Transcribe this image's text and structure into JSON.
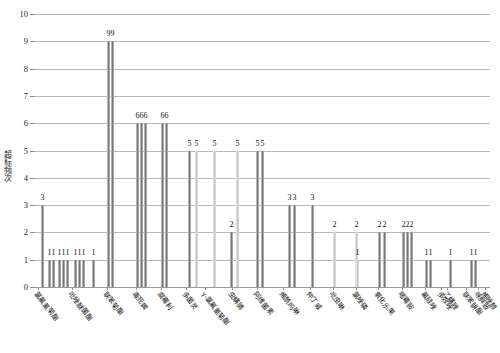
{
  "chart_data": {
    "type": "bar",
    "title": "",
    "subtitle": "",
    "xlabel": "",
    "ylabel": "超标频次",
    "ylim": [
      0,
      10
    ],
    "yticks": [
      0,
      1,
      2,
      3,
      4,
      5,
      6,
      7,
      8,
      9,
      10
    ],
    "ytick_labels": [
      "0",
      "1",
      "2",
      "3",
      "4",
      "5",
      "6",
      "7",
      "8",
      "9",
      "10"
    ],
    "grid": true,
    "legend": null,
    "bar_color": "#8f8f8f",
    "categories": [
      "氯氟氰菊酯",
      "氯氰菊酯",
      "吡唑醚菌酯",
      "腐霉利",
      "联苯菊酯",
      "毒死蜱",
      "克百威",
      "多菌灵",
      "甲拌磷",
      "氟虫腈",
      "啶虫脒",
      "三唑磷",
      "乙酰甲胺磷",
      "灭多威",
      "氧乐果",
      "氟氯氰菊酯",
      "γ-氯氟氰菊酯",
      "丙溴磷",
      "虫螨腈",
      "苯醚甲环唑",
      "阿维菌素",
      "烯酰吗啉",
      "吡虫啉",
      "哒螨灵",
      "仲丁威",
      "氯唑磷",
      "吡蚜酮",
      "氧化乐果",
      "敌敌畏",
      "噻虫嗪",
      "嘧霉胺",
      "戊唑醇",
      "氟硅唑",
      "乙螨唑",
      "灭蝇胺",
      "联苯肼酯",
      "唑螨酯",
      "烯唑醇",
      "多效唑",
      "甲霜灵",
      "水胺硫磷",
      "异丙威",
      "喹硫磷",
      "噻嗪酮",
      "百菌清",
      "氯吡脲",
      "咪鲜胺"
    ],
    "values": [
      3,
      1,
      1,
      1,
      1,
      1,
      1,
      1,
      1,
      1,
      9,
      9,
      6,
      6,
      6,
      6,
      6,
      5,
      5,
      5,
      5,
      5,
      5,
      2,
      3,
      3,
      3,
      2,
      2,
      1,
      2,
      2,
      2,
      2,
      2,
      1,
      1,
      1,
      1,
      1,
      1,
      1,
      1,
      1,
      6,
      1,
      1
    ],
    "bars": [
      {
        "x": 41,
        "v": 3,
        "label": "3",
        "lx": 41,
        "pale": false
      },
      {
        "x": 48,
        "v": 1,
        "label": "1",
        "lx": 48,
        "pale": false
      },
      {
        "x": 52,
        "v": 1,
        "label": "1",
        "lx": 52,
        "pale": false
      },
      {
        "x": 58,
        "v": 1,
        "label": "1",
        "lx": 58,
        "pale": false
      },
      {
        "x": 62,
        "v": 1,
        "label": "1",
        "lx": 62,
        "pale": false
      },
      {
        "x": 66,
        "v": 1,
        "label": "1",
        "lx": 66,
        "pale": false
      },
      {
        "x": 74,
        "v": 1,
        "label": "1",
        "lx": 74,
        "pale": false
      },
      {
        "x": 78,
        "v": 1,
        "label": "1",
        "lx": 78,
        "pale": false
      },
      {
        "x": 82,
        "v": 1,
        "label": "1",
        "lx": 82,
        "pale": false
      },
      {
        "x": 92,
        "v": 1,
        "label": "1",
        "lx": 92,
        "pale": false
      },
      {
        "x": 107,
        "v": 9,
        "label": "9",
        "lx": 107,
        "pale": false
      },
      {
        "x": 111,
        "v": 9,
        "label": "9",
        "lx": 111,
        "pale": false
      },
      {
        "x": 136,
        "v": 6,
        "label": "6",
        "lx": 136,
        "pale": false
      },
      {
        "x": 140,
        "v": 6,
        "label": "6",
        "lx": 140,
        "pale": false
      },
      {
        "x": 144,
        "v": 6,
        "label": "6",
        "lx": 144,
        "pale": false
      },
      {
        "x": 161,
        "v": 6,
        "label": "6",
        "lx": 161,
        "pale": false
      },
      {
        "x": 165,
        "v": 6,
        "label": "6",
        "lx": 165,
        "pale": false
      },
      {
        "x": 188,
        "v": 5,
        "label": "5",
        "lx": 188,
        "pale": false
      },
      {
        "x": 195,
        "v": 5,
        "label": "5",
        "lx": 195,
        "pale": true
      },
      {
        "x": 213,
        "v": 5,
        "label": "5",
        "lx": 213,
        "pale": true
      },
      {
        "x": 236,
        "v": 5,
        "label": "5",
        "lx": 236,
        "pale": true
      },
      {
        "x": 256,
        "v": 5,
        "label": "5",
        "lx": 256,
        "pale": false
      },
      {
        "x": 261,
        "v": 5,
        "label": "5",
        "lx": 261,
        "pale": false
      },
      {
        "x": 230,
        "v": 2,
        "label": "2",
        "lx": 230,
        "pale": false
      },
      {
        "x": 288,
        "v": 3,
        "label": "3",
        "lx": 288,
        "pale": false
      },
      {
        "x": 293,
        "v": 3,
        "label": "3",
        "lx": 293,
        "pale": false
      },
      {
        "x": 311,
        "v": 3,
        "label": "3",
        "lx": 311,
        "pale": false
      },
      {
        "x": 333,
        "v": 2,
        "label": "2",
        "lx": 333,
        "pale": true
      },
      {
        "x": 355,
        "v": 2,
        "label": "2",
        "lx": 355,
        "pale": true
      },
      {
        "x": 356,
        "v": 1,
        "label": "1",
        "lx": 356,
        "pale": true
      },
      {
        "x": 378,
        "v": 2,
        "label": "2",
        "lx": 378,
        "pale": false
      },
      {
        "x": 383,
        "v": 2,
        "label": "2",
        "lx": 383,
        "pale": false
      },
      {
        "x": 402,
        "v": 2,
        "label": "2",
        "lx": 402,
        "pale": false
      },
      {
        "x": 406,
        "v": 2,
        "label": "2",
        "lx": 406,
        "pale": false
      },
      {
        "x": 410,
        "v": 2,
        "label": "2",
        "lx": 410,
        "pale": false
      },
      {
        "x": 425,
        "v": 1,
        "label": "1",
        "lx": 425,
        "pale": false
      },
      {
        "x": 429,
        "v": 1,
        "label": "1",
        "lx": 429,
        "pale": false
      },
      {
        "x": 449,
        "v": 1,
        "label": "1",
        "lx": 449,
        "pale": false
      },
      {
        "x": 470,
        "v": 1,
        "label": "1",
        "lx": 470,
        "pale": false
      },
      {
        "x": 474,
        "v": 1,
        "label": "1",
        "lx": 474,
        "pale": false
      }
    ],
    "annotations": [
      {
        "text": "99",
        "x": 109,
        "y": 9
      },
      {
        "text": "666",
        "x": 140,
        "y": 6
      },
      {
        "text": "66",
        "x": 163,
        "y": 6
      },
      {
        "text": "55",
        "x": 191,
        "y": 5
      }
    ]
  },
  "axis": {
    "y_title": "超标频次",
    "x_labels": [
      {
        "text": "氯氟氰菊酯",
        "x": 38
      },
      {
        "text": "吡唑醚菌酯",
        "x": 72
      },
      {
        "text": "联苯菊酯",
        "x": 107
      },
      {
        "text": "毒死蜱",
        "x": 136
      },
      {
        "text": "腐霉利",
        "x": 161
      },
      {
        "text": "多菌灵",
        "x": 186
      },
      {
        "text": "γ-氯氟氰菊酯",
        "x": 205
      },
      {
        "text": "虫螨腈",
        "x": 232
      },
      {
        "text": "阿维菌素",
        "x": 257
      },
      {
        "text": "烯酰吗啉",
        "x": 283
      },
      {
        "text": "仲丁威",
        "x": 310
      },
      {
        "text": "吡虫啉",
        "x": 333
      },
      {
        "text": "氯唑磷",
        "x": 356
      },
      {
        "text": "氧化乐果",
        "x": 378
      },
      {
        "text": "嘧霉胺",
        "x": 402
      },
      {
        "text": "氟硅唑",
        "x": 425
      },
      {
        "text": "乙螨唑",
        "x": 447
      },
      {
        "text": "联苯肼酯",
        "x": 466
      },
      {
        "text": "烯唑醇",
        "x": 485
      },
      {
        "text": "多效唑",
        "x": 441
      },
      {
        "text": "咪鲜胺",
        "x": 478
      }
    ]
  }
}
